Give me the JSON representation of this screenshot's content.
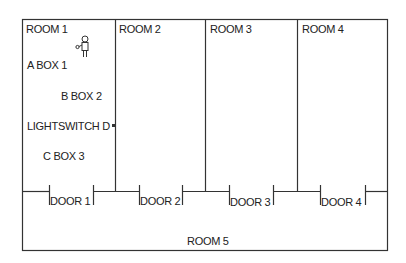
{
  "rooms": {
    "room1": "ROOM 1",
    "room2": "ROOM 2",
    "room3": "ROOM 3",
    "room4": "ROOM 4",
    "room5": "ROOM 5"
  },
  "objects": {
    "box1": "A  BOX 1",
    "box2": "B  BOX 2",
    "lightswitch": "LIGHTSWITCH D",
    "box3": "C  BOX 3"
  },
  "doors": [
    "DOOR 1",
    "DOOR 2",
    "DOOR 3",
    "DOOR 4"
  ],
  "icons": {
    "person": "person-icon"
  }
}
